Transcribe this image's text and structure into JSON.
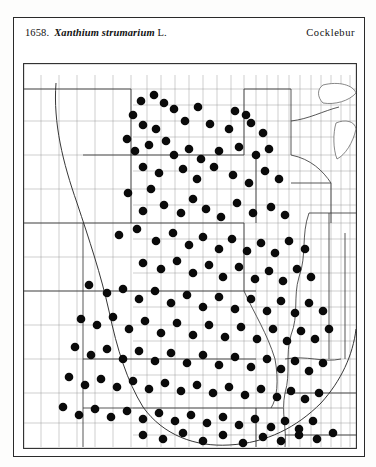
{
  "plate": {
    "caption": {
      "number": "1658.",
      "scientific_name": "Xanthium strumarium",
      "authority": "L.",
      "common_name": "Cocklebur"
    },
    "map": {
      "kind": "county-dot-distribution-map",
      "region": "Central United States",
      "symbol": "filled-black-circle",
      "symbol_meaning": "county record",
      "range_line": "continuous range boundary"
    }
  },
  "chart_data": {
    "type": "scatter",
    "subtitle": "County distribution, central United States",
    "xlabel": "",
    "ylabel": "",
    "xlim": [
      0,
      334
    ],
    "ylim": [
      0,
      386
    ],
    "grid": false,
    "legend": "none",
    "marker": "filled circle",
    "marker_color": "#0a0a0a",
    "marker_size_px": 8.6,
    "states_shown": [
      "North Dakota",
      "South Dakota",
      "Nebraska",
      "Kansas",
      "Oklahoma",
      "Minnesota",
      "Iowa",
      "Missouri",
      "Arkansas",
      "Wisconsin",
      "Illinois",
      "Michigan",
      "Indiana",
      "Kentucky",
      "Tennessee",
      "Ohio",
      "Mississippi",
      "Louisiana",
      "Texas",
      "Colorado",
      "Wyoming",
      "Montana"
    ],
    "points": [
      [
        118,
        38
      ],
      [
        131,
        32
      ],
      [
        141,
        40
      ],
      [
        110,
        52
      ],
      [
        151,
        46
      ],
      [
        175,
        44
      ],
      [
        212,
        48
      ],
      [
        223,
        52
      ],
      [
        120,
        62
      ],
      [
        133,
        66
      ],
      [
        162,
        58
      ],
      [
        187,
        61
      ],
      [
        206,
        66
      ],
      [
        228,
        60
      ],
      [
        240,
        70
      ],
      [
        104,
        76
      ],
      [
        112,
        88
      ],
      [
        126,
        82
      ],
      [
        143,
        78
      ],
      [
        151,
        92
      ],
      [
        166,
        86
      ],
      [
        178,
        96
      ],
      [
        196,
        88
      ],
      [
        216,
        84
      ],
      [
        233,
        92
      ],
      [
        246,
        86
      ],
      [
        120,
        104
      ],
      [
        136,
        110
      ],
      [
        160,
        106
      ],
      [
        174,
        116
      ],
      [
        191,
        104
      ],
      [
        210,
        112
      ],
      [
        226,
        120
      ],
      [
        242,
        108
      ],
      [
        256,
        116
      ],
      [
        105,
        130
      ],
      [
        128,
        126
      ],
      [
        120,
        148
      ],
      [
        141,
        142
      ],
      [
        158,
        150
      ],
      [
        170,
        136
      ],
      [
        183,
        146
      ],
      [
        198,
        154
      ],
      [
        214,
        140
      ],
      [
        230,
        150
      ],
      [
        248,
        144
      ],
      [
        262,
        152
      ],
      [
        96,
        172
      ],
      [
        114,
        166
      ],
      [
        133,
        178
      ],
      [
        150,
        170
      ],
      [
        166,
        182
      ],
      [
        180,
        174
      ],
      [
        196,
        186
      ],
      [
        209,
        176
      ],
      [
        224,
        188
      ],
      [
        238,
        180
      ],
      [
        252,
        190
      ],
      [
        266,
        178
      ],
      [
        282,
        186
      ],
      [
        120,
        200
      ],
      [
        138,
        206
      ],
      [
        154,
        198
      ],
      [
        170,
        210
      ],
      [
        186,
        202
      ],
      [
        200,
        214
      ],
      [
        216,
        204
      ],
      [
        232,
        216
      ],
      [
        246,
        208
      ],
      [
        260,
        218
      ],
      [
        274,
        206
      ],
      [
        288,
        214
      ],
      [
        66,
        222
      ],
      [
        84,
        230
      ],
      [
        100,
        226
      ],
      [
        116,
        236
      ],
      [
        132,
        228
      ],
      [
        148,
        240
      ],
      [
        164,
        232
      ],
      [
        180,
        244
      ],
      [
        196,
        234
      ],
      [
        212,
        246
      ],
      [
        228,
        236
      ],
      [
        244,
        248
      ],
      [
        258,
        238
      ],
      [
        272,
        250
      ],
      [
        286,
        240
      ],
      [
        300,
        248
      ],
      [
        58,
        256
      ],
      [
        74,
        262
      ],
      [
        90,
        254
      ],
      [
        106,
        266
      ],
      [
        122,
        258
      ],
      [
        138,
        270
      ],
      [
        154,
        260
      ],
      [
        170,
        272
      ],
      [
        186,
        262
      ],
      [
        202,
        274
      ],
      [
        218,
        264
      ],
      [
        234,
        276
      ],
      [
        250,
        266
      ],
      [
        264,
        278
      ],
      [
        278,
        268
      ],
      [
        292,
        276
      ],
      [
        306,
        266
      ],
      [
        52,
        284
      ],
      [
        68,
        292
      ],
      [
        84,
        286
      ],
      [
        100,
        296
      ],
      [
        116,
        288
      ],
      [
        132,
        298
      ],
      [
        148,
        290
      ],
      [
        164,
        300
      ],
      [
        180,
        292
      ],
      [
        196,
        302
      ],
      [
        212,
        294
      ],
      [
        228,
        304
      ],
      [
        244,
        296
      ],
      [
        258,
        306
      ],
      [
        272,
        298
      ],
      [
        286,
        308
      ],
      [
        300,
        300
      ],
      [
        46,
        314
      ],
      [
        62,
        322
      ],
      [
        78,
        316
      ],
      [
        94,
        324
      ],
      [
        110,
        318
      ],
      [
        126,
        326
      ],
      [
        142,
        320
      ],
      [
        158,
        328
      ],
      [
        174,
        322
      ],
      [
        190,
        330
      ],
      [
        206,
        324
      ],
      [
        222,
        332
      ],
      [
        238,
        326
      ],
      [
        254,
        334
      ],
      [
        268,
        328
      ],
      [
        282,
        336
      ],
      [
        296,
        330
      ],
      [
        40,
        344
      ],
      [
        56,
        352
      ],
      [
        72,
        346
      ],
      [
        88,
        354
      ],
      [
        104,
        348
      ],
      [
        120,
        356
      ],
      [
        136,
        350
      ],
      [
        152,
        358
      ],
      [
        168,
        352
      ],
      [
        184,
        360
      ],
      [
        200,
        354
      ],
      [
        216,
        362
      ],
      [
        232,
        356
      ],
      [
        248,
        364
      ],
      [
        262,
        358
      ],
      [
        276,
        366
      ],
      [
        290,
        358
      ],
      [
        120,
        372
      ],
      [
        140,
        376
      ],
      [
        160,
        370
      ],
      [
        180,
        378
      ],
      [
        200,
        372
      ],
      [
        220,
        380
      ],
      [
        240,
        374
      ],
      [
        258,
        378
      ],
      [
        276,
        372
      ],
      [
        294,
        376
      ],
      [
        310,
        370
      ]
    ],
    "density_note": "Highest dot density in Missouri, Illinois, eastern Kansas and Iowa; sparse in the Dakotas, Minnesota, Wisconsin, Michigan and the western Great Plains."
  }
}
